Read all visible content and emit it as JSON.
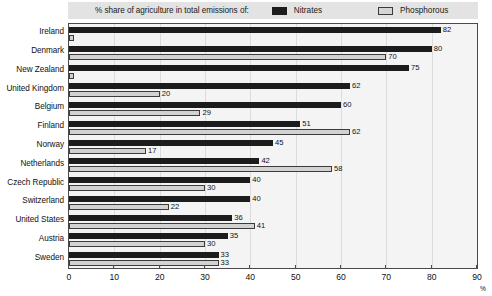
{
  "legend": {
    "caption": "% share of agriculture in total emissions of:",
    "entries": [
      {
        "label": "Nitrates",
        "color": "#1c1c1c",
        "icon": "legend-swatch-nitrates"
      },
      {
        "label": "Phosphorous",
        "color": "#d2d2d2",
        "icon": "legend-swatch-phosphorous"
      }
    ]
  },
  "axis": {
    "unit": "%",
    "ticks": [
      "0",
      "10",
      "20",
      "30",
      "40",
      "50",
      "60",
      "70",
      "80",
      "90"
    ]
  },
  "chart_data": {
    "type": "bar",
    "orientation": "horizontal",
    "title": "% share of agriculture in total emissions of:",
    "xlabel": "%",
    "ylabel": "",
    "xlim": [
      0,
      90
    ],
    "grid": true,
    "legend_position": "top",
    "categories": [
      "Ireland",
      "Denmark",
      "New Zealand",
      "United Kingdom",
      "Belgium",
      "Finland",
      "Norway",
      "Netherlands",
      "Czech Republic",
      "Switzerland",
      "United States",
      "Austria",
      "Sweden"
    ],
    "series": [
      {
        "name": "Nitrates",
        "color": "#1c1c1c",
        "values": [
          82,
          80,
          75,
          62,
          60,
          51,
          45,
          42,
          40,
          40,
          36,
          35,
          33
        ]
      },
      {
        "name": "Phosphorous",
        "color": "#d2d2d2",
        "values": [
          1,
          70,
          1,
          20,
          29,
          62,
          17,
          58,
          30,
          22,
          41,
          30,
          33
        ]
      }
    ],
    "value_labels": {
      "Nitrates": [
        "82",
        "80",
        "75",
        "62",
        "60",
        "51",
        "45",
        "42",
        "40",
        "40",
        "36",
        "35",
        "33"
      ],
      "Phosphorous": [
        "",
        "70",
        "",
        "20",
        "29",
        "62",
        "17",
        "58",
        "30",
        "22",
        "41",
        "30",
        "33"
      ]
    }
  }
}
